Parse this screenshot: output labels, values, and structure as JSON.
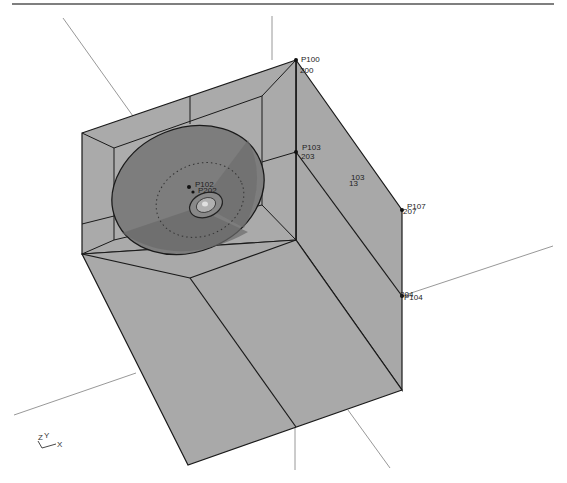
{
  "viewport": {
    "type": "3d-cad-wireframe-shaded",
    "background": "#ffffff",
    "frame_line_color": "#555555",
    "face_color": "#a9a9a9",
    "face_color_light": "#b3b3b3",
    "edge_color": "#1a1a1a",
    "dish_color": "#7a7a7a",
    "dish_shadow_color": "#6a6a6a",
    "construction_line_color": "#8c8c8c"
  },
  "points": [
    {
      "label": "P100",
      "sub": "200"
    },
    {
      "label": "P103",
      "sub": "203"
    },
    {
      "label": "P107",
      "sub": "207"
    },
    {
      "label": "P104",
      "sub": "204"
    },
    {
      "label": "P102",
      "sub": "P202"
    },
    {
      "label": "103",
      "sub": "13"
    }
  ],
  "axis_triad": {
    "z": "Z",
    "y": "Y",
    "x": "X"
  }
}
